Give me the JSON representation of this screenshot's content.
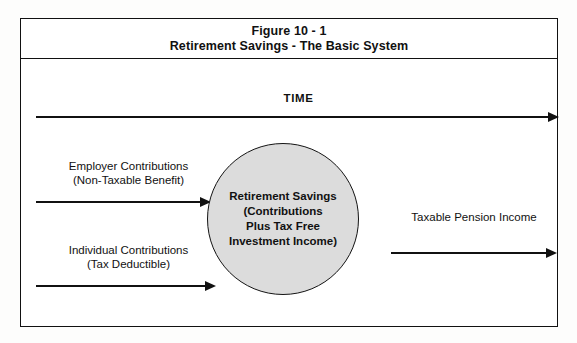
{
  "figure": {
    "title_line1": "Figure 10 - 1",
    "title_line2": "Retirement Savings - The Basic System"
  },
  "timeline": {
    "label": "TIME",
    "arrow_name": "time-arrow"
  },
  "inputs": [
    {
      "id": "employer",
      "line1": "Employer Contributions",
      "line2": "(Non-Taxable Benefit)"
    },
    {
      "id": "individual",
      "line1": "Individual Contributions",
      "line2": "(Tax Deductible)"
    }
  ],
  "center": {
    "line1": "Retirement Savings",
    "line2": "(Contributions",
    "line3": "Plus Tax Free",
    "line4": "Investment Income)",
    "fill_color": "#dcdcdc",
    "stroke_color": "#141414"
  },
  "output": {
    "label": "Taxable Pension Income"
  },
  "colors": {
    "ink": "#111111",
    "page": "#fdfdfc",
    "panel": "#ffffff"
  }
}
